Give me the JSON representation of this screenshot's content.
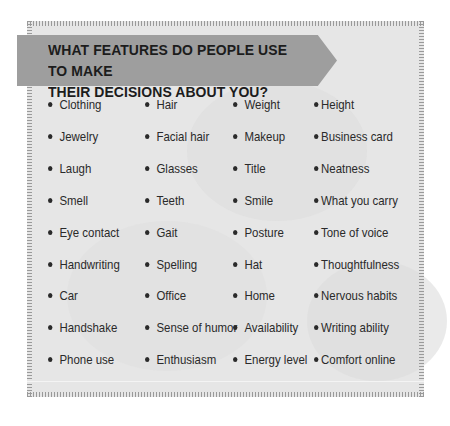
{
  "title": "WHAT FEATURES DO PEOPLE USE TO MAKE THEIR DECISIONS ABOUT YOU?",
  "title_lines": [
    "WHAT FEATURES DO PEOPLE USE TO MAKE",
    "THEIR DECISIONS ABOUT YOU?"
  ],
  "columns": [
    [
      "Clothing",
      "Jewelry",
      "Laugh",
      "Smell",
      "Eye contact",
      "Handwriting",
      "Car",
      "Handshake",
      "Phone use"
    ],
    [
      "Hair",
      "Facial hair",
      "Glasses",
      "Teeth",
      "Gait",
      "Spelling",
      "Office",
      "Sense of humor",
      "Enthusiasm"
    ],
    [
      "Weight",
      "Makeup",
      "Title",
      "Smile",
      "Posture",
      "Hat",
      "Home",
      "Availability",
      "Energy level"
    ],
    [
      "Height",
      "Business card",
      "Neatness",
      "What you carry",
      "Tone of voice",
      "Thoughtfulness",
      "Nervous habits",
      "Writing ability",
      "Comfort online"
    ]
  ],
  "colors": {
    "banner": "#9e9e9e",
    "panel": "#e6e6e6",
    "text": "#2a2a2a"
  }
}
